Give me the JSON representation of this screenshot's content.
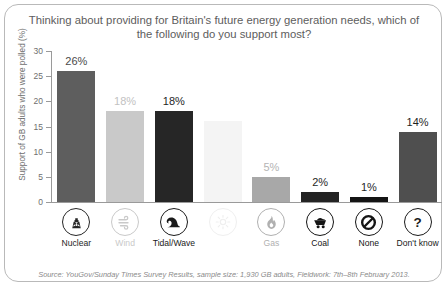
{
  "card": {
    "title": "Thinking about providing for Britain's future energy generation needs, which of the following do you support most?",
    "source": "Source: YouGov/Sunday Times Survey Results, sample size: 1,930 GB adults, Fieldwork: 7th–8th February 2013."
  },
  "chart_data": {
    "type": "bar",
    "title": "Thinking about providing for Britain's future energy generation needs, which of the following do you support most?",
    "xlabel": "",
    "ylabel": "Support of GB adults who were polled (%)",
    "ylim": [
      0,
      30
    ],
    "yticks": [
      0,
      5,
      10,
      15,
      20,
      25,
      30
    ],
    "ytick_labels": [
      "0",
      "5",
      "10",
      "15",
      "20",
      "25",
      "30"
    ],
    "grid": false,
    "legend": "none",
    "categories": [
      "Nuclear",
      "Wind",
      "Tidal/Wave",
      "Solar",
      "Gas",
      "Coal",
      "None",
      "Don't know"
    ],
    "values": [
      26,
      18,
      18,
      16,
      5,
      2,
      1,
      14
    ],
    "data_labels": [
      "26%",
      "18%",
      "18%",
      "",
      "5%",
      "2%",
      "1%",
      "14%"
    ],
    "bar_colors": [
      "#5e5e5e",
      "#c9c9c9",
      "#262626",
      "#f4f4f4",
      "#a8a8a8",
      "#232323",
      "#141414",
      "#4f4f4f"
    ],
    "label_colors": [
      "#4a4a4a",
      "#c2c2c2",
      "#1f1f1f",
      "#ffffff",
      "#b4b4b4",
      "#1f1f1f",
      "#1f1f1f",
      "#1f1f1f"
    ],
    "icon_colors": [
      "#262626",
      "#c9c9c9",
      "#1a1a1a",
      "#efefef",
      "#b0b0b0",
      "#151515",
      "#151515",
      "#1a1a1a"
    ],
    "icons": [
      "nuclear-icon",
      "wind-icon",
      "wave-icon",
      "sun-icon",
      "flame-icon",
      "coal-cart-icon",
      "prohibition-icon",
      "question-mark-icon"
    ],
    "category_label_visible": [
      true,
      true,
      true,
      false,
      true,
      true,
      true,
      true
    ],
    "source": "Source: YouGov/Sunday Times Survey Results, sample size: 1,930 GB adults, Fieldwork: 7th–8th February 2013."
  }
}
